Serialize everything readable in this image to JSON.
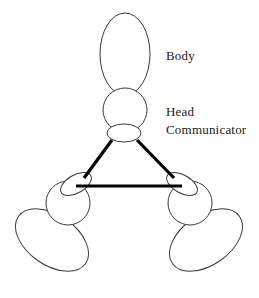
{
  "figure": {
    "background_color": "#ffffff",
    "outline_color": "#3a3a3a",
    "link_color": "#000000",
    "text_color": "#1a1a1a",
    "width": 259,
    "height": 298
  },
  "labels": {
    "body": "Body",
    "head": "Head",
    "communicator": "Communicator"
  },
  "label_positions": {
    "body": {
      "x": 166,
      "y": 60
    },
    "head": {
      "x": 166,
      "y": 116
    },
    "communicator": {
      "x": 166,
      "y": 134
    }
  },
  "robots": [
    {
      "id": "top",
      "name": "robot-top",
      "rotation_deg": 0,
      "body": {
        "cx": 125,
        "cy": 54,
        "rx": 25,
        "ry": 41
      },
      "head": {
        "cx": 125,
        "cy": 110,
        "r": 22
      },
      "communicator": {
        "cx": 124,
        "cy": 133,
        "rx": 17,
        "ry": 9,
        "rotation_deg": 0
      }
    },
    {
      "id": "bottom-left",
      "name": "robot-bottom-left",
      "rotation_deg": 125,
      "body": {
        "cx": 52,
        "cy": 240,
        "rx": 25,
        "ry": 41
      },
      "head": {
        "cx": 68,
        "cy": 203,
        "r": 22
      },
      "communicator": {
        "cx": 76,
        "cy": 184,
        "rx": 17,
        "ry": 9,
        "rotation_deg": -30
      }
    },
    {
      "id": "bottom-right",
      "name": "robot-bottom-right",
      "rotation_deg": -125,
      "body": {
        "cx": 206,
        "cy": 240,
        "rx": 25,
        "ry": 41
      },
      "head": {
        "cx": 190,
        "cy": 203,
        "r": 22
      },
      "communicator": {
        "cx": 182,
        "cy": 184,
        "rx": 17,
        "ry": 9,
        "rotation_deg": 30
      }
    }
  ],
  "links": [
    {
      "id": "top-to-left",
      "name": "comm-link-top-left",
      "x1": 112,
      "y1": 140,
      "x2": 84,
      "y2": 178
    },
    {
      "id": "top-to-right",
      "name": "comm-link-top-right",
      "x1": 137,
      "y1": 140,
      "x2": 174,
      "y2": 178
    },
    {
      "id": "left-to-right",
      "name": "comm-link-left-right",
      "x1": 76,
      "y1": 186,
      "x2": 182,
      "y2": 186
    }
  ]
}
